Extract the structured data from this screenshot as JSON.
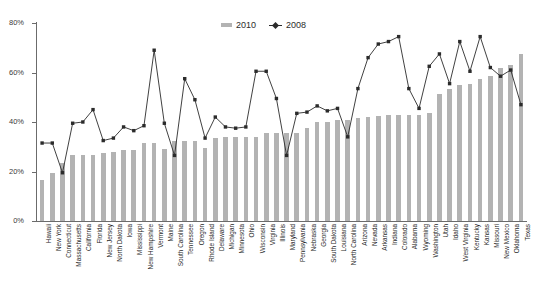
{
  "chart_data": {
    "type": "bar",
    "title": "",
    "subtitle": "",
    "xlabel": "",
    "ylabel": "",
    "ylim": [
      0,
      80
    ],
    "yticks": [
      "0%",
      "20%",
      "40%",
      "60%",
      "80%"
    ],
    "ytick_values": [
      0,
      20,
      40,
      60,
      80
    ],
    "grid": false,
    "legend_position": "top-center",
    "legend": [
      "2010",
      "2008"
    ],
    "colors": {
      "bar_2010": "#b3b3b3",
      "line_2008": "#2b2b2b",
      "axis": "#6b6b6b",
      "text": "#1f1f1f",
      "background": "#ffffff"
    },
    "categories": [
      "Hawaii",
      "New York",
      "Connecticut",
      "Massachusetts",
      "California",
      "Florida",
      "New Jersey",
      "North Dakota",
      "Iowa",
      "Mississippi",
      "New Hampshire",
      "Vermont",
      "Maine",
      "South Carolina",
      "Tennessee",
      "Oregon",
      "Rhode Island",
      "Delaware",
      "Michigan",
      "Minnesota",
      "Ohio",
      "Wisconsin",
      "Virginia",
      "Illinois",
      "Maryland",
      "Pennsylvania",
      "Nebraska",
      "Georgia",
      "South Dakota",
      "Louisiana",
      "North Carolina",
      "Arizona",
      "Nevada",
      "Arkansas",
      "Indiana",
      "Colorado",
      "Alabama",
      "Wyoming",
      "Washington",
      "Utah",
      "Idaho",
      "West Virginia",
      "Kentucky",
      "Kansas",
      "Missouri",
      "New Mexico",
      "Oklahoma",
      "Texas"
    ],
    "series": [
      {
        "name": "2010",
        "type": "bar",
        "values": [
          16.5,
          19.5,
          23.5,
          26.5,
          26.5,
          26.5,
          27.5,
          28.0,
          28.5,
          28.5,
          31.5,
          31.5,
          29.0,
          32.5,
          32.5,
          32.5,
          29.5,
          33.5,
          34.0,
          34.0,
          34.0,
          34.0,
          35.5,
          35.5,
          35.5,
          35.5,
          37.5,
          40.0,
          40.0,
          41.0,
          41.0,
          41.5,
          42.0,
          42.5,
          43.0,
          43.0,
          43.0,
          43.0,
          43.5,
          51.5,
          53.5,
          55.0,
          55.5,
          57.5,
          58.5,
          62.0,
          63.0,
          67.5
        ]
      },
      {
        "name": "2008",
        "type": "line",
        "values": [
          31.5,
          31.5,
          19.5,
          39.5,
          40.0,
          45.0,
          32.5,
          33.5,
          38.0,
          36.5,
          38.5,
          69.0,
          39.5,
          26.5,
          57.5,
          49.0,
          33.5,
          42.0,
          38.0,
          37.5,
          38.0,
          60.5,
          60.5,
          49.5,
          26.5,
          43.5,
          44.0,
          46.5,
          44.5,
          45.5,
          34.0,
          53.5,
          66.0,
          71.5,
          72.5,
          74.5,
          53.5,
          45.5,
          62.5,
          67.5,
          55.5,
          72.5,
          60.5,
          74.5,
          62.0,
          58.5,
          61.0,
          47.0
        ]
      }
    ]
  }
}
